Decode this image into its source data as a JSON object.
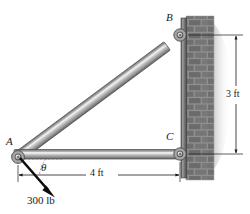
{
  "figure": {
    "background_color": "#ffffff",
    "width": 250,
    "height": 214
  },
  "labels": {
    "point_a": "A",
    "point_b": "B",
    "point_c": "C",
    "angle_theta": "θ",
    "dim_vertical": "3 ft",
    "dim_horizontal": "4 ft",
    "force_magnitude": "300 lb"
  },
  "geometry": {
    "joint_a": {
      "x": 18,
      "y": 157
    },
    "joint_b": {
      "x": 180,
      "y": 35
    },
    "joint_c": {
      "x": 180,
      "y": 154
    },
    "force_tip": {
      "x": 53,
      "y": 194
    },
    "members": [
      {
        "name": "member-ab",
        "from": "A",
        "to": "B",
        "type": "diagonal-bar"
      },
      {
        "name": "member-ac",
        "from": "A",
        "to": "C",
        "type": "horizontal-bar"
      }
    ]
  },
  "dimensions": [
    {
      "name": "vertical-3ft",
      "label": "3 ft",
      "from": "B",
      "to": "C",
      "orientation": "vertical"
    },
    {
      "name": "horizontal-4ft",
      "label": "4 ft",
      "from": "A",
      "to": "wall",
      "orientation": "horizontal"
    }
  ],
  "force": {
    "label": "300 lb",
    "applied_at": "A",
    "direction": "down-left",
    "angle_label": "θ",
    "angle_reference": "horizontal"
  },
  "wall": {
    "type": "brick-wall",
    "position": "right",
    "plate": "mounting-plate"
  },
  "colors": {
    "member_fill": "#9a9a9a",
    "member_highlight": "#d6d6d6",
    "member_edge": "#555555",
    "brick_base": "#8d8d8d",
    "brick_mortar": "#e2e2e2",
    "plate": "#7e7e7e",
    "line": "#1a1a1a",
    "shadow": "#b8b8b8"
  }
}
